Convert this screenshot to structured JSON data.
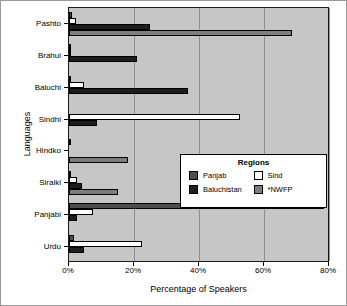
{
  "chart_data": {
    "type": "bar",
    "orientation": "horizontal",
    "title": "",
    "xlabel": "Percentage of Speakers",
    "ylabel": "Languages",
    "xlim": [
      0,
      80
    ],
    "xticks": [
      0,
      20,
      40,
      60,
      80
    ],
    "xtick_labels": [
      "0%",
      "20%",
      "40%",
      "60%",
      "80%"
    ],
    "grid": "vertical",
    "legend_title": "Regions",
    "legend_position": "center-right-inside",
    "categories": [
      "Pashto",
      "Brahui",
      "Baluchi",
      "Sindhi",
      "Hindko",
      "Siraiki",
      "Panjabi",
      "Urdu"
    ],
    "series": [
      {
        "name": "Panjab",
        "color": "#4d4d4d",
        "values": [
          1.0,
          0.3,
          0.5,
          0.0,
          0.4,
          0.5,
          78.5,
          1.5
        ]
      },
      {
        "name": "Sind",
        "color": "#ffffff",
        "values": [
          2.0,
          0.3,
          4.5,
          52.5,
          0.0,
          2.5,
          7.5,
          22.5
        ]
      },
      {
        "name": "Baluchistan",
        "color": "#1e1e1e",
        "values": [
          25.0,
          21.0,
          36.5,
          8.5,
          0.0,
          4.0,
          2.5,
          4.5
        ]
      },
      {
        "name": "*NWFP",
        "color": "#7d7d7d",
        "values": [
          68.5,
          0.0,
          0.0,
          0.0,
          18.0,
          15.0,
          0.0,
          0.0
        ]
      }
    ]
  },
  "legend": {
    "title": "Regions",
    "items": [
      {
        "label": "Panjab",
        "swatch": "sw-panjab"
      },
      {
        "label": "Sind",
        "swatch": "sw-sind"
      },
      {
        "label": "Baluchistan",
        "swatch": "sw-baluchistan"
      },
      {
        "label": "*NWFP",
        "swatch": "sw-nwfp"
      }
    ]
  },
  "axes": {
    "x_title": "Percentage of Speakers",
    "y_title": "Languages"
  }
}
